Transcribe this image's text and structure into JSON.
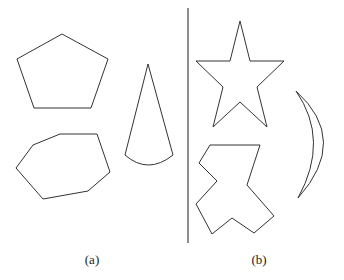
{
  "figure": {
    "panels": [
      {
        "label": "(a)",
        "shapes": [
          {
            "name": "pentagon",
            "points": "62,34 108,59 91,108 34,108 17,59"
          },
          {
            "name": "heptagon",
            "points": "60,134 97,134 110,172 88,191 43,199 16,168 33,145"
          },
          {
            "name": "cone",
            "path": "M148,64 L125,155 Q148,175 173,155 Z"
          }
        ]
      },
      {
        "label": "(b)",
        "shapes": [
          {
            "name": "star",
            "points": "240,21 250,61 284,61 257,87 267,127 240,102 213,127 223,87 196,61 230,61"
          },
          {
            "name": "cross-polygon",
            "points": "210,145 260,145 247,185 274,216 254,233 232,218 212,234 196,204 217,181 199,163"
          },
          {
            "name": "crescent",
            "path": "M296,91 Q350,140 298,198 Q330,140 296,91 Z"
          }
        ]
      }
    ],
    "divider": {
      "x": 188,
      "y1": 8,
      "y2": 243
    }
  }
}
